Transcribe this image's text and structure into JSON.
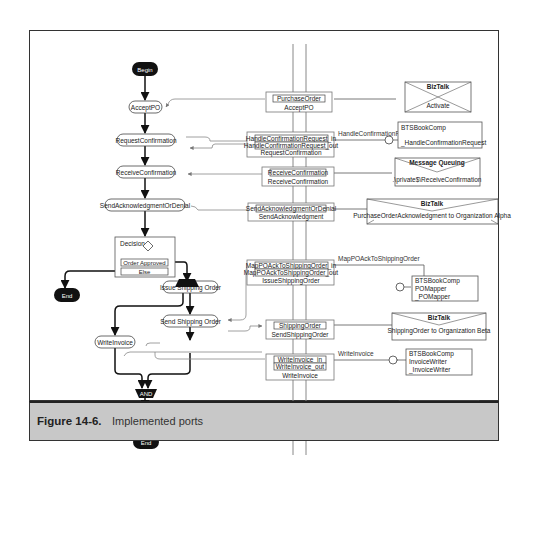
{
  "figure": {
    "number": "Figure 14-6.",
    "title": "Implemented ports"
  },
  "flow": {
    "begin": "Begin",
    "end_top": "End",
    "end_bottom": "End",
    "shapes": [
      "AcceptPO",
      "RequestConfirmation",
      "ReceiveConfirmation",
      "SendAcknowledgmentOrDenial",
      "Issue Shipping Order",
      "Send Shipping Order",
      "WriteInvoice",
      "SendInvoice"
    ],
    "decision": {
      "label": "Decision",
      "rule": "Order Approved",
      "else": "Else"
    },
    "join": "AND"
  },
  "ports": [
    {
      "name": "AcceptPO",
      "messages": [
        "PurchaseOrder"
      ]
    },
    {
      "name": "RequestConfirmation",
      "messages": [
        "HandleConfirmationRequest_in",
        "HandleConfirmationRequest_out"
      ]
    },
    {
      "name": "ReceiveConfirmation",
      "messages": [
        "ReceiveConfirmation"
      ]
    },
    {
      "name": "SendAcknowledgment",
      "messages": [
        "SendAcknowledgmentOrDenial"
      ]
    },
    {
      "name": "IssueShippingOrder",
      "messages": [
        "MapPOAckToShippingOrder_in",
        "MapPOAckToShippingOrder_out"
      ]
    },
    {
      "name": "SendShippingOrder",
      "messages": [
        "ShippingOrder"
      ]
    },
    {
      "name": "WriteInvoice",
      "messages": [
        "WriteInvoice_in",
        "WriteInvoice_out"
      ]
    },
    {
      "name": "SendInvoice",
      "messages": [
        "Invoice"
      ]
    }
  ],
  "implementations": [
    {
      "type": "BizTalk",
      "label": "Activate"
    },
    {
      "type": "COM",
      "lines": [
        "BTSBookComp",
        "_HandleConfirmationRequest"
      ],
      "method": "HandleConfirmationRequest"
    },
    {
      "type": "Message Queuing",
      "label": ".\\private$\\ReceiveConfirmation"
    },
    {
      "type": "BizTalk",
      "label": "PurchaseOrderAcknowledgment to Organization Alpha"
    },
    {
      "type": "COM",
      "lines": [
        "BTSBookComp",
        "POMapper",
        "_POMapper"
      ],
      "method": "MapPOAckToShippingOrder"
    },
    {
      "type": "BizTalk",
      "label": "ShippingOrder to Organization Beta"
    },
    {
      "type": "COM",
      "lines": [
        "BTSBookComp",
        "InvoiceWriter",
        "_InvoiceWriter"
      ],
      "method": "WriteInvoice"
    },
    {
      "type": "BizTalk",
      "label": "Invoice to Organization Alpha"
    }
  ]
}
